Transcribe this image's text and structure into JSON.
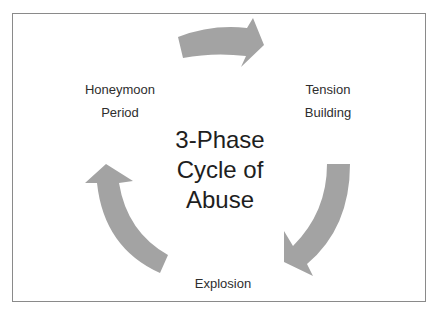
{
  "diagram": {
    "title_lines": [
      "3-Phase",
      "Cycle of",
      "Abuse"
    ],
    "phases": [
      {
        "id": "honeymoon",
        "lines": [
          "Honeymoon",
          "Period"
        ]
      },
      {
        "id": "tension",
        "lines": [
          "Tension",
          "Building"
        ]
      },
      {
        "id": "explosion",
        "lines": [
          "Explosion"
        ]
      }
    ],
    "arrows": [
      {
        "from": "honeymoon",
        "to": "tension",
        "direction": "clockwise"
      },
      {
        "from": "tension",
        "to": "explosion",
        "direction": "clockwise"
      },
      {
        "from": "explosion",
        "to": "honeymoon",
        "direction": "clockwise"
      }
    ],
    "colors": {
      "arrow": "#a3a3a3",
      "border": "#8a8a8a",
      "text": "#2a2a2a"
    }
  }
}
